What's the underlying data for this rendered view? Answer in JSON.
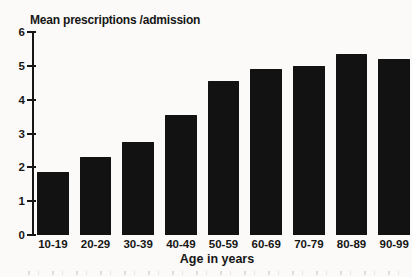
{
  "chart_data": {
    "type": "bar",
    "title": "Mean prescriptions /admission",
    "xlabel": "Age in years",
    "ylabel": "",
    "categories": [
      "10-19",
      "20-29",
      "30-39",
      "40-49",
      "50-59",
      "60-69",
      "70-79",
      "80-89",
      "90-99"
    ],
    "values": [
      1.85,
      2.3,
      2.75,
      3.55,
      4.55,
      4.9,
      5.0,
      5.35,
      5.2
    ],
    "ylim": [
      0,
      6
    ],
    "yticks": [
      0,
      1,
      2,
      3,
      4,
      5,
      6
    ],
    "grid": false,
    "legend": null,
    "bar_color": "#121212",
    "background_color": "#fbfaf8",
    "text_color": "#161616"
  }
}
